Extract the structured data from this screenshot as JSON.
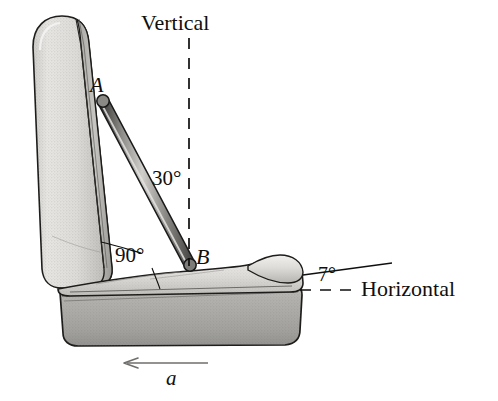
{
  "figure": {
    "background_color": "#ffffff",
    "ink_color": "#100f0d",
    "width": 498,
    "height": 401
  },
  "labels": {
    "vertical": "Vertical",
    "horizontal": "Horizontal",
    "angle_strut_to_vertical": "30°",
    "angle_seat_back_to_cushion": "90°",
    "angle_cushion_to_horizontal": "7°",
    "point_a": "A",
    "point_b": "B",
    "acceleration": "a"
  },
  "geometry": {
    "strut": {
      "from_label": "A",
      "to_label": "B",
      "from_point": [
        103,
        101
      ],
      "to_point": [
        190,
        265
      ],
      "angle_from_vertical_deg": 30,
      "color": "#8d8d8d",
      "outline_color": "#1a1a1a"
    },
    "vertical_reference_line": {
      "style": "dashed",
      "x": 189,
      "y_top": 38,
      "y_bottom": 266
    },
    "horizontal_reference_line": {
      "style": "dashed",
      "y": 290,
      "x_left": 300,
      "x_right": 356
    },
    "cushion_reference_line": {
      "style": "solid",
      "from_point": [
        303,
        274
      ],
      "to_point": [
        390,
        263
      ],
      "slope_deg": 7
    },
    "acceleration_arrow": {
      "direction": "left",
      "from_point": [
        206,
        363
      ],
      "to_point": [
        124,
        363
      ]
    },
    "leader_90_upper": {
      "from_point": [
        142,
        252
      ],
      "to_point": [
        101,
        243
      ]
    },
    "leader_90_lower": {
      "from_point": [
        152,
        267
      ],
      "to_point": [
        160,
        288
      ]
    },
    "leader_7": {
      "from_point": [
        303,
        274
      ],
      "to_point": [
        390,
        263
      ]
    }
  },
  "seat": {
    "back": {
      "name": "seat-back-cushion",
      "tilt_deg": 7,
      "fill_light": "#ededeb",
      "fill_mid": "#d3d2cf",
      "fill_dark": "#a9a8a4"
    },
    "cushion": {
      "name": "seat-bottom-cushion",
      "slope_deg": 7,
      "fill_light": "#e8e7e4",
      "fill_mid": "#c9c8c4"
    },
    "base": {
      "name": "seat-base-block",
      "fill_light": "#b9b8b4",
      "fill_dark": "#8e8d89"
    }
  }
}
